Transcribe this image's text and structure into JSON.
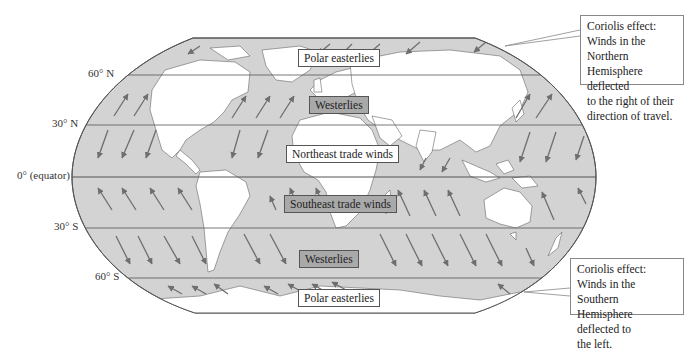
{
  "figure": {
    "colors": {
      "ocean": "#d3d3d3",
      "land": "#ffffff",
      "arrow": "#6e6e6e",
      "outline": "#555555",
      "dark_label_bg": "#a9a9a9"
    }
  },
  "latitudes": [
    {
      "label": "60° N",
      "y": 75
    },
    {
      "label": "30° N",
      "y": 125
    },
    {
      "label": "0° (equator)",
      "y": 177
    },
    {
      "label": "30° S",
      "y": 228
    },
    {
      "label": "60° S",
      "y": 278
    }
  ],
  "wind_belts": [
    {
      "name": "Polar easterlies",
      "hemisphere": "N",
      "style": "light"
    },
    {
      "name": "Westerlies",
      "hemisphere": "N",
      "style": "dark"
    },
    {
      "name": "Northeast trade winds",
      "hemisphere": "N",
      "style": "light"
    },
    {
      "name": "Southeast trade winds",
      "hemisphere": "S",
      "style": "dark"
    },
    {
      "name": "Westerlies",
      "hemisphere": "S",
      "style": "dark"
    },
    {
      "name": "Polar easterlies",
      "hemisphere": "S",
      "style": "light"
    }
  ],
  "callouts": {
    "north": {
      "lines": [
        "Coriolis effect:",
        "Winds in the Northern",
        "Hemisphere deflected",
        "to the right of their",
        "direction of travel."
      ]
    },
    "south": {
      "lines": [
        "Coriolis effect:",
        "Winds in the Southern",
        "Hemisphere deflected to",
        "the left."
      ]
    }
  }
}
